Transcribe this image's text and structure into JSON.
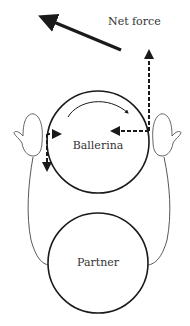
{
  "diagram": {
    "type": "force-diagram",
    "labels": {
      "net_force": "Net force",
      "ballerina": "Ballerina",
      "partner": "Partner"
    },
    "colors": {
      "stroke": "#1a1a1a",
      "outline": "#555555",
      "background": "#ffffff"
    },
    "elements": [
      {
        "name": "net-force-arrow",
        "style": "solid-thick",
        "direction": "up-left"
      },
      {
        "name": "rotation-arrow",
        "style": "curved",
        "direction": "clockwise"
      },
      {
        "name": "right-hand-force-up",
        "style": "dashed",
        "direction": "up"
      },
      {
        "name": "right-hand-force-left",
        "style": "dashed",
        "direction": "left"
      },
      {
        "name": "left-hand-force-right",
        "style": "dashed",
        "direction": "right"
      },
      {
        "name": "left-hand-force-down",
        "style": "dashed",
        "direction": "down"
      }
    ]
  }
}
